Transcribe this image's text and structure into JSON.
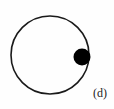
{
  "figure": {
    "panel_label": "(d)",
    "background_color": "#fefefe",
    "stroke_color": "#1a1a1a",
    "fill_color": "#000000",
    "circle": {
      "name": "circle-outline",
      "center_x": 50,
      "center_y": 55,
      "radius": 39,
      "stroke_width": 1.6,
      "filled": false
    },
    "marker": {
      "name": "filled-dot-marker",
      "center_x": 82,
      "center_y": 57,
      "radius": 8.5,
      "filled": true,
      "angle_degrees": -3
    }
  },
  "chart_data": {
    "type": "scatter",
    "title": "",
    "subtitle": "",
    "xlabel": "",
    "ylabel": "",
    "annotations": [
      "(d)"
    ],
    "legend": [],
    "grid": false,
    "xlim": [
      0,
      114
    ],
    "ylim": [
      0,
      109
    ],
    "shapes": [
      {
        "kind": "circle",
        "label": "circle-outline",
        "cx": 50,
        "cy": 55,
        "r": 39,
        "fill": "none",
        "stroke": "#1a1a1a"
      },
      {
        "kind": "circle",
        "label": "filled-dot-marker",
        "cx": 82,
        "cy": 57,
        "r": 8.5,
        "fill": "#000000",
        "stroke": "none"
      }
    ],
    "x": [
      82
    ],
    "y": [
      57
    ]
  }
}
